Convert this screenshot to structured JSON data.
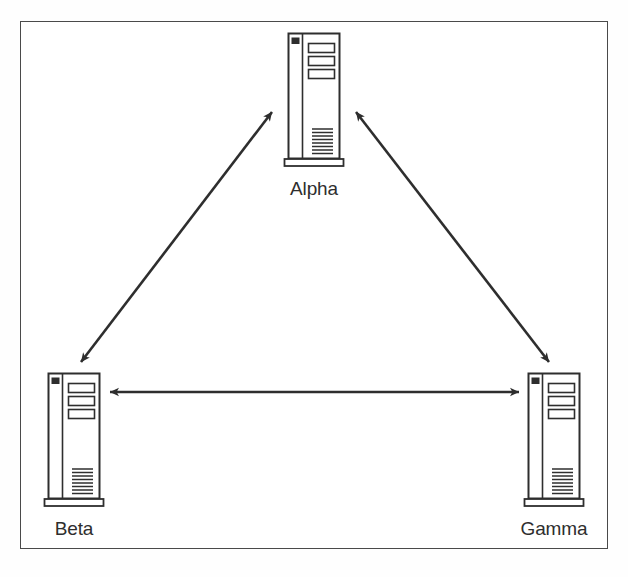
{
  "figure": {
    "type": "network-topology-diagram",
    "style": "scanned grayscale line art",
    "frame": {
      "border_color": "#4a4a4a",
      "background": "#ffffff"
    },
    "ink_color": "#2e2e2e",
    "fill_color": "#ffffff"
  },
  "nodes": [
    {
      "id": "alpha",
      "label": "Alpha",
      "icon": "server-tower-icon",
      "position": "top-center",
      "x": 314,
      "y": 31,
      "drive_bays": 3,
      "vent_lines": 9,
      "power_led": true
    },
    {
      "id": "beta",
      "label": "Beta",
      "icon": "server-tower-icon",
      "position": "bottom-left",
      "x": 74,
      "y": 371,
      "drive_bays": 3,
      "vent_lines": 9,
      "power_led": true
    },
    {
      "id": "gamma",
      "label": "Gamma",
      "icon": "server-tower-icon",
      "position": "bottom-right",
      "x": 554,
      "y": 371,
      "drive_bays": 3,
      "vent_lines": 9,
      "power_led": true
    }
  ],
  "links": [
    {
      "id": "link-beta-alpha",
      "from": "beta",
      "to": "alpha",
      "direction": "bidirectional",
      "arrowheads": "both",
      "label": ""
    },
    {
      "id": "link-alpha-gamma",
      "from": "alpha",
      "to": "gamma",
      "direction": "bidirectional",
      "arrowheads": "both",
      "label": ""
    },
    {
      "id": "link-beta-gamma",
      "from": "beta",
      "to": "gamma",
      "direction": "bidirectional",
      "arrowheads": "both",
      "label": ""
    }
  ],
  "labels": {
    "alpha": "Alpha",
    "beta": "Beta",
    "gamma": "Gamma"
  },
  "caption": ""
}
